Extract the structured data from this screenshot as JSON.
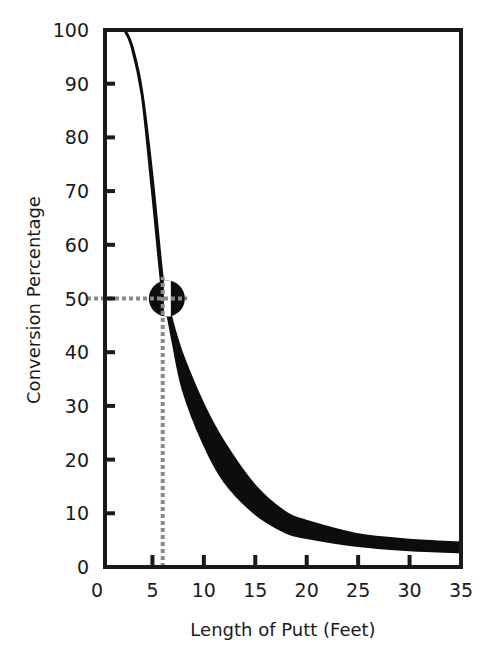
{
  "chart_data": {
    "type": "area",
    "title": "",
    "xlabel": "Length of Putt (Feet)",
    "ylabel": "Conversion Percentage",
    "xlim": [
      0,
      35
    ],
    "ylim": [
      0,
      100
    ],
    "x_ticks": [
      0,
      5,
      10,
      15,
      20,
      25,
      30,
      35
    ],
    "y_ticks": [
      0,
      10,
      20,
      30,
      40,
      50,
      60,
      70,
      80,
      90,
      100
    ],
    "grid": false,
    "legend": null,
    "series": [
      {
        "name": "Conversion band upper edge",
        "x": [
          2.3,
          3,
          4,
          5,
          6,
          6.5,
          7,
          8,
          10,
          12,
          15,
          18,
          20,
          25,
          30,
          35
        ],
        "values": [
          100,
          97,
          88,
          72,
          53,
          49,
          45,
          39,
          30,
          23,
          15,
          10,
          8.5,
          6,
          5,
          4.5
        ]
      },
      {
        "name": "Conversion band lower edge",
        "x": [
          2.3,
          3,
          4,
          5,
          6,
          6.5,
          7,
          8,
          10,
          12,
          15,
          18,
          20,
          25,
          30,
          35
        ],
        "values": [
          100,
          97,
          88,
          70,
          51,
          47,
          42,
          33,
          23,
          16,
          10,
          6.5,
          5.5,
          4,
          3.2,
          2.8
        ]
      }
    ],
    "annotations": [
      {
        "type": "marker",
        "shape": "circle",
        "x": 6.5,
        "y": 50,
        "label": "50% conversion point"
      },
      {
        "type": "dotted-line",
        "orientation": "horizontal",
        "y": 50,
        "from_x": 0,
        "to_x": 8
      },
      {
        "type": "dotted-line",
        "orientation": "vertical",
        "x": 6,
        "from_y": 0,
        "to_y": 54
      }
    ]
  },
  "axes": {
    "x_label": "Length of Putt (Feet)",
    "y_label": "Conversion Percentage",
    "x_tick_labels": [
      "0",
      "5",
      "10",
      "15",
      "20",
      "25",
      "30",
      "35"
    ],
    "y_tick_labels": [
      "0",
      "10",
      "20",
      "30",
      "40",
      "50",
      "60",
      "70",
      "80",
      "90",
      "100"
    ]
  },
  "colors": {
    "band": "#0d0d0d",
    "axis": "#1a1a1a",
    "guide": "#8a8a8a",
    "background": "#ffffff"
  }
}
